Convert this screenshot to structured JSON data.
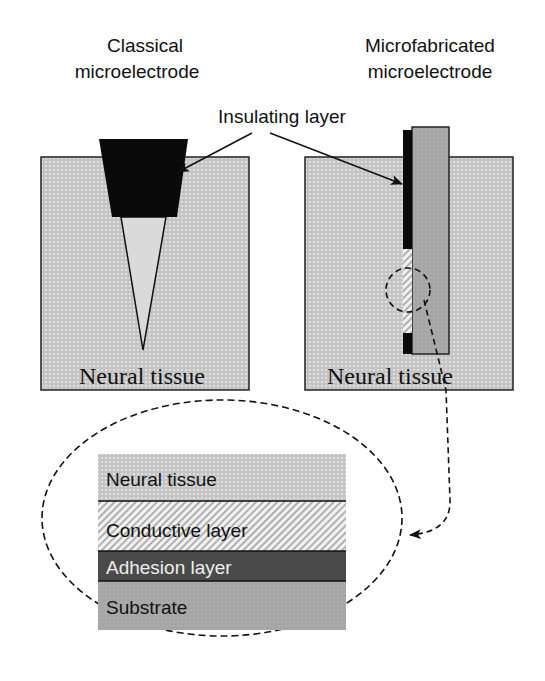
{
  "titles": {
    "left_line1": "Classical",
    "left_line2": "microelectrode",
    "right_line1": "Microfabricated",
    "right_line2": "microelectrode"
  },
  "callouts": {
    "insulating": "Insulating layer"
  },
  "panels": {
    "left_tissue": "Neural tissue",
    "right_tissue": "Neural tissue"
  },
  "detail": {
    "layers": [
      {
        "label": "Neural tissue",
        "color": "#cfcfcf"
      },
      {
        "label": "Conductive layer",
        "color": "#e6e6e6"
      },
      {
        "label": "Adhesion layer",
        "color": "#4a4a4a"
      },
      {
        "label": "Substrate",
        "color": "#a9a9a9"
      }
    ]
  },
  "colors": {
    "tissue": "#cdcdcd",
    "insulator": "#0a0a0a",
    "substrate": "#a8a8a8",
    "cone": "#dadada"
  }
}
